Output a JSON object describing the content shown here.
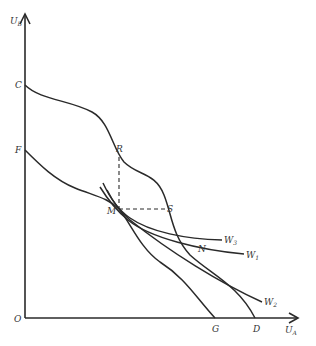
{
  "diagram": {
    "type": "utility possibility frontier",
    "axes": {
      "y_label": "U",
      "y_sub": "B",
      "x_label": "U",
      "x_sub": "A",
      "origin": "O"
    },
    "points": {
      "C": "C",
      "F": "F",
      "R": "R",
      "S": "S",
      "M": "M",
      "N": "N",
      "G": "G",
      "D": "D"
    },
    "welfare_curves": [
      {
        "label": "W",
        "sub": "3"
      },
      {
        "label": "W",
        "sub": "1"
      },
      {
        "label": "W",
        "sub": "2"
      }
    ],
    "colors": {
      "line": "#2a2a2a",
      "background": "#ffffff"
    }
  }
}
